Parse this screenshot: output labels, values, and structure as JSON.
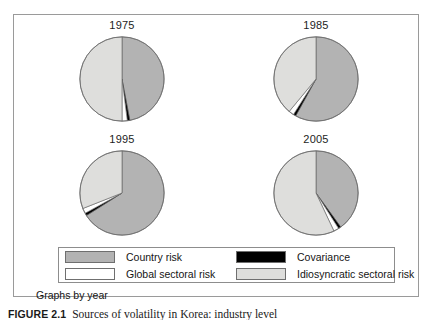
{
  "figure": {
    "panel_label": "Graphs by year",
    "caption_number": "FIGURE 2.1",
    "caption_text": "Sources of volatility in Korea: industry level",
    "border_color": "#9a9a9a"
  },
  "legend": {
    "items": [
      {
        "key": "country_risk",
        "label": "Country risk",
        "color": "#b3b3b3",
        "row": 0,
        "col": 0
      },
      {
        "key": "covariance",
        "label": "Covariance",
        "color": "#000000",
        "row": 0,
        "col": 1
      },
      {
        "key": "global_sectoral",
        "label": "Global sectoral risk",
        "color": "#ffffff",
        "row": 1,
        "col": 0
      },
      {
        "key": "idiosyncratic",
        "label": "Idiosyncratic sectoral risk",
        "color": "#dededc",
        "row": 1,
        "col": 1
      }
    ]
  },
  "chart_data": {
    "type": "pie",
    "title": "",
    "subtitle": "Graphs by year",
    "grid": false,
    "legend_position": "bottom",
    "slice_order": [
      "Country risk",
      "Covariance",
      "Global sectoral risk",
      "Idiosyncratic sectoral risk"
    ],
    "colors": {
      "Country risk": "#b3b3b3",
      "Covariance": "#000000",
      "Global sectoral risk": "#ffffff",
      "Idiosyncratic sectoral risk": "#dededc"
    },
    "charts": [
      {
        "title": "1975",
        "labels": [
          "Country risk",
          "Covariance",
          "Global sectoral risk",
          "Idiosyncratic sectoral risk"
        ],
        "values": [
          47,
          1,
          2,
          50
        ]
      },
      {
        "title": "1985",
        "labels": [
          "Country risk",
          "Covariance",
          "Global sectoral risk",
          "Idiosyncratic sectoral risk"
        ],
        "values": [
          58,
          1,
          2,
          39
        ]
      },
      {
        "title": "1995",
        "labels": [
          "Country risk",
          "Covariance",
          "Global sectoral risk",
          "Idiosyncratic sectoral risk"
        ],
        "values": [
          66,
          1,
          2,
          31
        ]
      },
      {
        "title": "2005",
        "labels": [
          "Country risk",
          "Covariance",
          "Global sectoral risk",
          "Idiosyncratic sectoral risk"
        ],
        "values": [
          40,
          1,
          2,
          57
        ]
      }
    ]
  }
}
